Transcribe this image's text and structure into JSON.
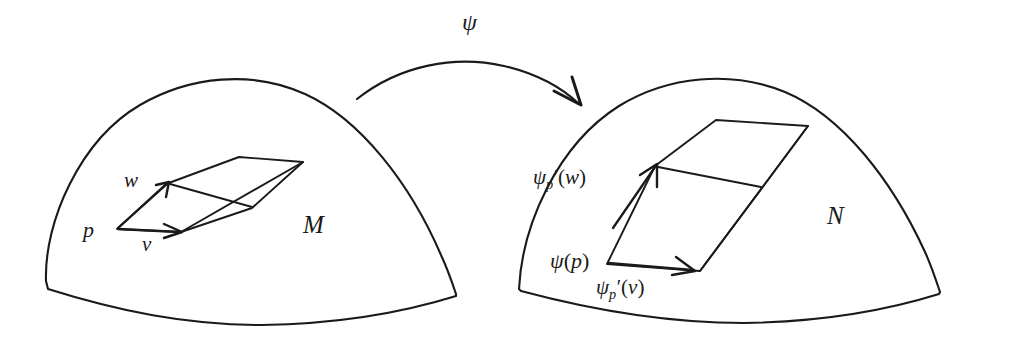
{
  "figure": {
    "type": "mathematical-diagram",
    "background_color": "#ffffff",
    "ink_color": "#1a1a1a"
  },
  "source_manifold": {
    "label": "M",
    "base_point_label": "p",
    "tangent_vectors": [
      {
        "name": "v-label",
        "label": "v"
      },
      {
        "name": "w-label",
        "label": "w"
      }
    ]
  },
  "target_manifold": {
    "label": "N",
    "base_point_label": "ψ(p)",
    "base_point_parts": {
      "psi": "ψ",
      "open": "(",
      "arg": "p",
      "close": ")"
    },
    "tangent_vectors": [
      {
        "name": "pushforward-v-label",
        "psi": "ψ",
        "subscript": "p",
        "prime": "′",
        "open": "(",
        "arg": "v",
        "close": ")"
      },
      {
        "name": "pushforward-w-label",
        "psi": "ψ",
        "subscript": "p",
        "prime": "′",
        "open": "(",
        "arg": "w",
        "close": ")"
      }
    ]
  },
  "map_arrow": {
    "label": "ψ",
    "direction": "left-to-right",
    "style": "curved-arc-with-arrowhead"
  }
}
